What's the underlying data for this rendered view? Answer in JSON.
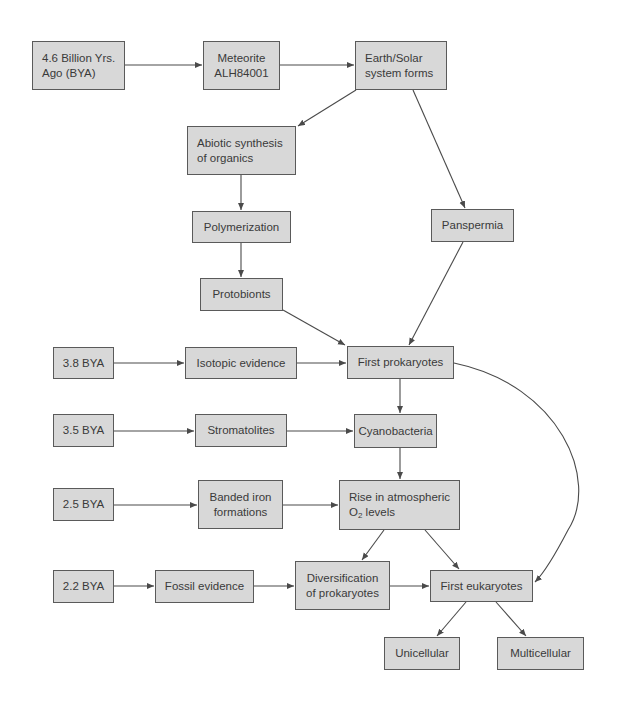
{
  "diagram": {
    "type": "flowchart",
    "colors": {
      "box_fill": "#d8d8d8",
      "box_border": "#5a5a5a",
      "text": "#3a3a3a",
      "arrow": "#4a4a4a"
    },
    "nodes": {
      "bya_46": "4.6 Billion Yrs.\nAgo (BYA)",
      "meteorite": "Meteorite\nALH84001",
      "earth_forms": "Earth/Solar\nsystem forms",
      "abiotic": "Abiotic synthesis\nof organics",
      "polymerization": "Polymerization",
      "panspermia": "Panspermia",
      "protobionts": "Protobionts",
      "bya_38": "3.8 BYA",
      "isotopic": "Isotopic evidence",
      "first_prokaryotes": "First prokaryotes",
      "bya_35": "3.5 BYA",
      "stromatolites": "Stromatolites",
      "cyanobacteria": "Cyanobacteria",
      "bya_25": "2.5 BYA",
      "banded_iron": "Banded iron\nformations",
      "rise_o2_line1": "Rise in atmospheric",
      "rise_o2_o": "O",
      "rise_o2_sub": "2",
      "rise_o2_rest": " levels",
      "bya_22": "2.2 BYA",
      "fossil": "Fossil evidence",
      "diversification": "Diversification\nof prokaryotes",
      "first_eukaryotes": "First eukaryotes",
      "unicellular": "Unicellular",
      "multicellular": "Multicellular"
    },
    "edges": [
      [
        "4.6 Billion Yrs. Ago (BYA)",
        "Meteorite ALH84001"
      ],
      [
        "Meteorite ALH84001",
        "Earth/Solar system forms"
      ],
      [
        "Earth/Solar system forms",
        "Abiotic synthesis of organics"
      ],
      [
        "Earth/Solar system forms",
        "Panspermia"
      ],
      [
        "Abiotic synthesis of organics",
        "Polymerization"
      ],
      [
        "Polymerization",
        "Protobionts"
      ],
      [
        "Protobionts",
        "First prokaryotes"
      ],
      [
        "Panspermia",
        "First prokaryotes"
      ],
      [
        "3.8 BYA",
        "Isotopic evidence"
      ],
      [
        "Isotopic evidence",
        "First prokaryotes"
      ],
      [
        "First prokaryotes",
        "Cyanobacteria"
      ],
      [
        "First prokaryotes",
        "First eukaryotes"
      ],
      [
        "3.5 BYA",
        "Stromatolites"
      ],
      [
        "Stromatolites",
        "Cyanobacteria"
      ],
      [
        "Cyanobacteria",
        "Rise in atmospheric O2 levels"
      ],
      [
        "2.5 BYA",
        "Banded iron formations"
      ],
      [
        "Banded iron formations",
        "Rise in atmospheric O2 levels"
      ],
      [
        "Rise in atmospheric O2 levels",
        "Diversification of prokaryotes"
      ],
      [
        "Rise in atmospheric O2 levels",
        "First eukaryotes"
      ],
      [
        "2.2 BYA",
        "Fossil evidence"
      ],
      [
        "Fossil evidence",
        "Diversification of prokaryotes"
      ],
      [
        "Diversification of prokaryotes",
        "First eukaryotes"
      ],
      [
        "First eukaryotes",
        "Unicellular"
      ],
      [
        "First eukaryotes",
        "Multicellular"
      ]
    ]
  }
}
